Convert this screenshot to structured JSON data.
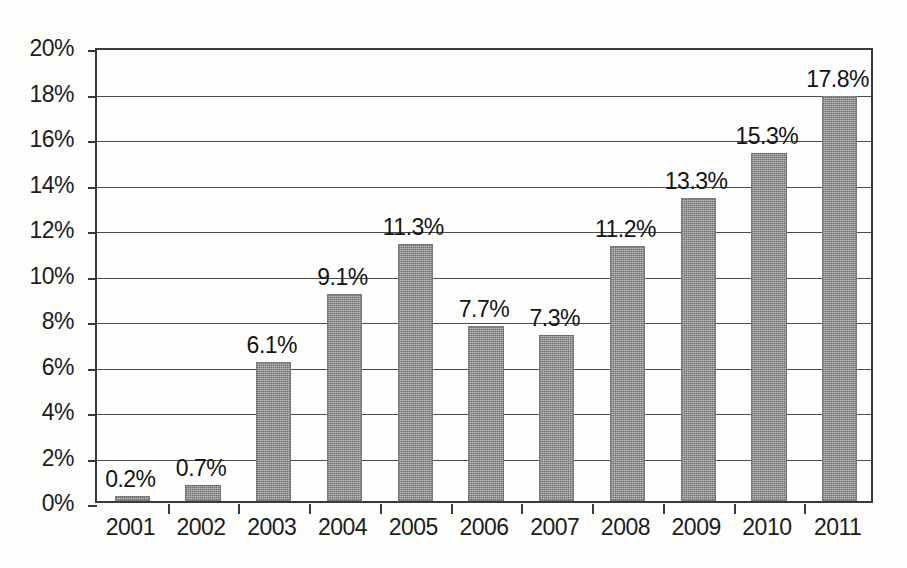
{
  "chart_data": {
    "type": "bar",
    "title": "",
    "subtitle": "",
    "xlabel": "",
    "ylabel": "",
    "categories": [
      "2001",
      "2002",
      "2003",
      "2004",
      "2005",
      "2006",
      "2007",
      "2008",
      "2009",
      "2010",
      "2011"
    ],
    "values": [
      0.2,
      0.7,
      6.1,
      9.1,
      11.3,
      7.7,
      7.3,
      11.2,
      13.3,
      15.3,
      17.8
    ],
    "data_labels": [
      "0.2%",
      "0.7%",
      "6.1%",
      "9.1%",
      "11.3%",
      "7.7%",
      "7.3%",
      "11.2%",
      "13.3%",
      "15.3%",
      "17.8%"
    ],
    "ylim": [
      0,
      20
    ],
    "ytick_values": [
      0,
      2,
      4,
      6,
      8,
      10,
      12,
      14,
      16,
      18,
      20
    ],
    "ytick_labels": [
      "0%",
      "2%",
      "4%",
      "6%",
      "8%",
      "10%",
      "12%",
      "14%",
      "16%",
      "18%",
      "20%"
    ],
    "grid": true,
    "grid_axis": "y",
    "legend": false,
    "legend_position": "none",
    "series": [
      {
        "name": "",
        "values": [
          0.2,
          0.7,
          6.1,
          9.1,
          11.3,
          7.7,
          7.3,
          11.2,
          13.3,
          15.3,
          17.8
        ]
      }
    ],
    "colors": {
      "bar_fill": "#8c8c8c",
      "axis": "#3a3a3a",
      "gridline": "#4a4a4a",
      "text": "#1c1c1c",
      "background": "#ffffff",
      "plot_background": "#fefefe"
    }
  }
}
